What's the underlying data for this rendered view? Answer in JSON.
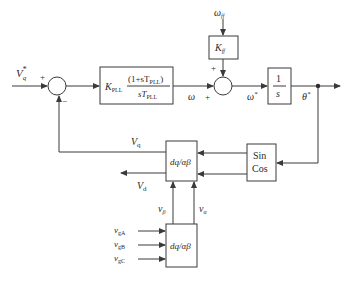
{
  "diagram": {
    "inputs": {
      "vq_ref": {
        "main": "V",
        "sub": "q",
        "sup": "*"
      },
      "omega_ff": {
        "main": "ω",
        "sub": "ff"
      },
      "vgA": {
        "main": "v",
        "sub": "gA"
      },
      "vgB": {
        "main": "v",
        "sub": "gB"
      },
      "vgC": {
        "main": "v",
        "sub": "gC"
      }
    },
    "sum1": {
      "plus": "+",
      "minus": "−"
    },
    "sum2": {
      "plus_top": "+",
      "plus_left": "+"
    },
    "blocks": {
      "pi": {
        "k": "K",
        "k_sub": "PLL",
        "num": "(1+sT",
        "num_sub": "PLL",
        "num_end": ")",
        "den": "sT",
        "den_sub": "PLL"
      },
      "kff": {
        "k": "K",
        "k_sub": "ff"
      },
      "integrator": {
        "num": "1",
        "den": "s"
      },
      "sincos": {
        "line1": "Sin",
        "line2": "Cos"
      },
      "transform_upper": {
        "label": "dq/αβ"
      },
      "transform_lower": {
        "label": "dq/αβ"
      }
    },
    "signals": {
      "omega": "ω",
      "omega_star": {
        "main": "ω",
        "sup": "*"
      },
      "theta_star": {
        "main": "θ",
        "sup": "*"
      },
      "vq": {
        "main": "V",
        "sub": "q"
      },
      "vd": {
        "main": "V",
        "sub": "d"
      },
      "v_beta": {
        "main": "v",
        "sub": "β"
      },
      "v_alpha": {
        "main": "v",
        "sub": "α"
      }
    }
  }
}
